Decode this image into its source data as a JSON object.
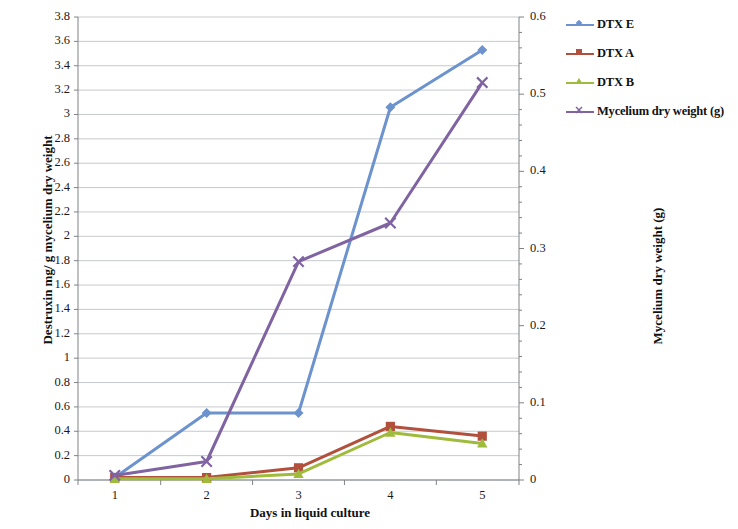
{
  "chart_data": {
    "type": "line",
    "title": "",
    "xlabel": "Days in liquid culture",
    "ylabel": "Destruxin mg/ g mycelium dry weight",
    "ylabel_secondary": "Mycelium dry weight (g)",
    "x": [
      1,
      2,
      3,
      4,
      5
    ],
    "xtick_labels": [
      "1",
      "2",
      "3",
      "4",
      "5"
    ],
    "xlim": [
      0.6,
      5.4
    ],
    "ylim": [
      0,
      3.8
    ],
    "ylim_secondary": [
      0,
      0.6
    ],
    "ytick_labels": [
      "0",
      "0.2",
      "0.4",
      "0.6",
      "0.8",
      "1",
      "1.2",
      "1.4",
      "1.6",
      "1.8",
      "2",
      "2.2",
      "2.4",
      "2.6",
      "2.8",
      "3",
      "3.2",
      "3.4",
      "3.6",
      "3.8"
    ],
    "ytick_values": [
      0,
      0.2,
      0.4,
      0.6,
      0.8,
      1,
      1.2,
      1.4,
      1.6,
      1.8,
      2,
      2.2,
      2.4,
      2.6,
      2.8,
      3,
      3.2,
      3.4,
      3.6,
      3.8
    ],
    "ytick_labels_secondary": [
      "0",
      "0.1",
      "0.2",
      "0.3",
      "0.4",
      "0.5",
      "0.6"
    ],
    "ytick_values_secondary": [
      0,
      0.1,
      0.2,
      0.3,
      0.4,
      0.5,
      0.6
    ],
    "grid": true,
    "grid_axis": "y",
    "legend_position": "top-right",
    "series": [
      {
        "name": "DTX E",
        "axis": "left",
        "color": "#6C93CE",
        "marker": "diamond",
        "values": [
          0.02,
          0.55,
          0.55,
          3.06,
          3.53
        ]
      },
      {
        "name": "DTX A",
        "axis": "left",
        "color": "#B1503C",
        "marker": "square",
        "values": [
          0.02,
          0.02,
          0.1,
          0.44,
          0.36
        ]
      },
      {
        "name": "DTX B",
        "axis": "left",
        "color": "#9FBB3B",
        "marker": "triangle",
        "values": [
          0.01,
          0.01,
          0.05,
          0.39,
          0.3
        ]
      },
      {
        "name": "Mycelium dry weight (g)",
        "axis": "right",
        "color": "#8064A2",
        "marker": "cross",
        "values": [
          0.006,
          0.024,
          0.283,
          0.333,
          0.515
        ]
      }
    ]
  },
  "legend": {
    "items": [
      {
        "label": "DTX E"
      },
      {
        "label": "DTX A"
      },
      {
        "label": "DTX B"
      },
      {
        "label": "Mycelium dry weight (g)"
      }
    ]
  }
}
